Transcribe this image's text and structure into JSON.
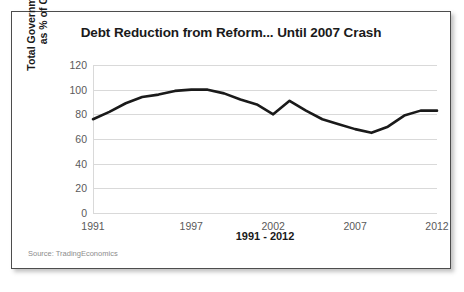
{
  "figure": {
    "title": "Debt Reduction from Reform... Until 2007 Crash",
    "source_note": "Source: TradingEconomics",
    "line_color": "#1a1a1a",
    "gridline_color": "#d9d9d9"
  },
  "chart_data": {
    "type": "line",
    "title": "Debt Reduction from Reform... Until 2007 Crash",
    "xlabel": "1991 - 2012",
    "ylabel": "Total Government Debt as % of GDP",
    "ylabel_line1": "Total Government Debt",
    "ylabel_line2": "as % of GDP",
    "grid": true,
    "legend": "none",
    "xlim": [
      1991,
      2012
    ],
    "ylim": [
      0,
      120
    ],
    "ytick_labels": [
      "120",
      "100",
      "80",
      "60",
      "40",
      "20",
      "0"
    ],
    "yticks": [
      120,
      100,
      80,
      60,
      40,
      20,
      0
    ],
    "xtick_labels": [
      "1991",
      "1997",
      "2002",
      "2007",
      "2012"
    ],
    "xticks": [
      1991,
      1997,
      2002,
      2007,
      2012
    ],
    "x": [
      1991,
      1992,
      1993,
      1994,
      1995,
      1996,
      1997,
      1998,
      1999,
      2000,
      2001,
      2002,
      2003,
      2004,
      2005,
      2006,
      2007,
      2008,
      2009,
      2010,
      2011,
      2012
    ],
    "values": [
      76,
      82,
      89,
      94,
      96,
      99,
      100,
      100,
      97,
      92,
      88,
      80,
      91,
      83,
      76,
      72,
      68,
      65,
      70,
      79,
      83,
      83
    ],
    "series": [
      {
        "name": "Total Government Debt as % of GDP",
        "values": [
          76,
          82,
          89,
          94,
          96,
          99,
          100,
          100,
          97,
          92,
          88,
          80,
          91,
          83,
          76,
          72,
          68,
          65,
          70,
          79,
          83,
          83
        ]
      }
    ]
  }
}
